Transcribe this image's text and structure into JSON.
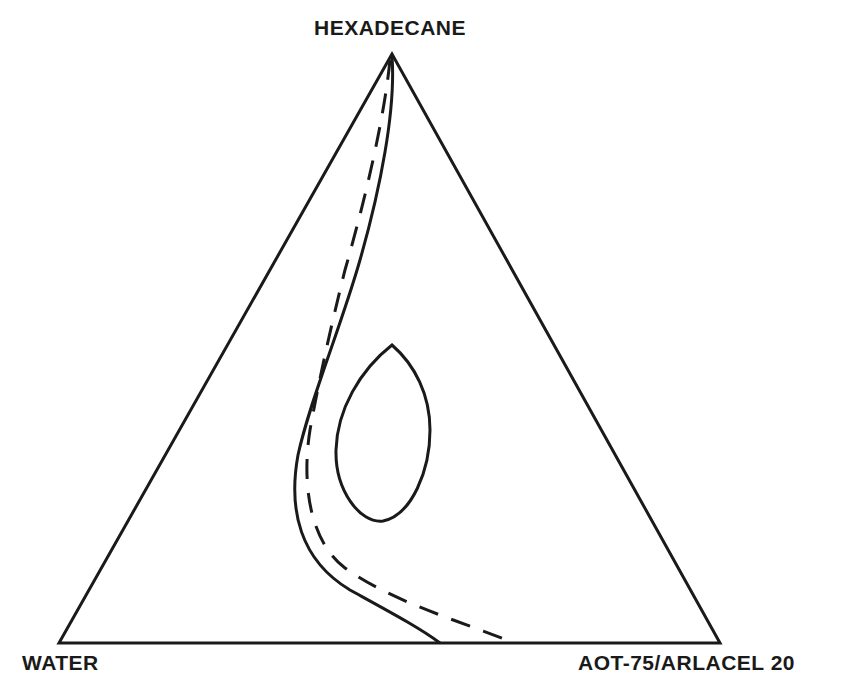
{
  "diagram": {
    "type": "ternary-phase-diagram",
    "vertices": {
      "top": "HEXADECANE",
      "bottom_left": "WATER",
      "bottom_right": "AOT-75/ARLACEL 20"
    },
    "curves": [
      {
        "name": "phase-boundary-solid",
        "style": "solid"
      },
      {
        "name": "phase-boundary-dashed",
        "style": "dashed"
      },
      {
        "name": "closed-region",
        "style": "solid-closed-loop"
      }
    ],
    "colors": {
      "line": "#1a1a1a",
      "background": "#ffffff"
    }
  }
}
